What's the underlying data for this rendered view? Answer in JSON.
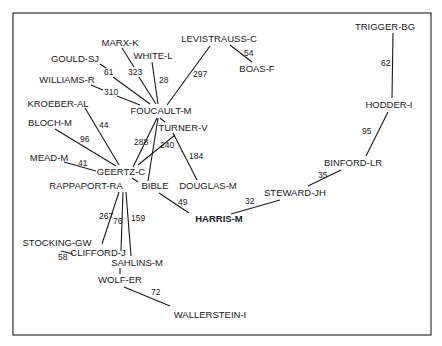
{
  "diagram": {
    "type": "network-graph",
    "nodes": [
      {
        "id": "TRIGGER-BG",
        "label": "TRIGGER-BG",
        "x": 385,
        "y": 30,
        "anchor": "middle"
      },
      {
        "id": "HODDER-I",
        "label": "HODDER-I",
        "x": 389,
        "y": 108,
        "anchor": "middle"
      },
      {
        "id": "BINFORD-LR",
        "label": "BINFORD-LR",
        "x": 353,
        "y": 166,
        "anchor": "middle"
      },
      {
        "id": "STEWARD-JH",
        "label": "STEWARD-JH",
        "x": 295,
        "y": 196,
        "anchor": "middle"
      },
      {
        "id": "HARRIS-M",
        "label": "HARRIS-M",
        "x": 219,
        "y": 222,
        "anchor": "middle",
        "bold": true
      },
      {
        "id": "LEVISTRAUSS-C",
        "label": "LEVISTRAUSS-C",
        "x": 219,
        "y": 42,
        "anchor": "middle"
      },
      {
        "id": "BOAS-F",
        "label": "BOAS-F",
        "x": 257,
        "y": 72,
        "anchor": "middle"
      },
      {
        "id": "MARX-K",
        "label": "MARX-K",
        "x": 120,
        "y": 46,
        "anchor": "middle"
      },
      {
        "id": "WHITE-L",
        "label": "WHITE-L",
        "x": 153,
        "y": 59,
        "anchor": "middle"
      },
      {
        "id": "GOULD-SJ",
        "label": "GOULD-SJ",
        "x": 75,
        "y": 62,
        "anchor": "middle"
      },
      {
        "id": "WILLIAMS-R",
        "label": "WILLIAMS-R",
        "x": 67,
        "y": 83,
        "anchor": "middle"
      },
      {
        "id": "FOUCAULT-M",
        "label": "FOUCAULT-M",
        "x": 161,
        "y": 114,
        "anchor": "middle"
      },
      {
        "id": "KROEBER-AL",
        "label": "KROEBER-AL",
        "x": 58,
        "y": 107,
        "anchor": "middle"
      },
      {
        "id": "TURNER-V",
        "label": "TURNER-V",
        "x": 183,
        "y": 131,
        "anchor": "middle"
      },
      {
        "id": "BLOCH-M",
        "label": "BLOCH-M",
        "x": 50,
        "y": 126,
        "anchor": "middle"
      },
      {
        "id": "MEAD-M",
        "label": "MEAD-M",
        "x": 49,
        "y": 161,
        "anchor": "middle"
      },
      {
        "id": "GEERTZ-C",
        "label": "GEERTZ-C",
        "x": 121,
        "y": 175,
        "anchor": "middle"
      },
      {
        "id": "RAPPAPORT-RA",
        "label": "RAPPAPORT-RA",
        "x": 86,
        "y": 189,
        "anchor": "middle"
      },
      {
        "id": "BIBLE",
        "label": "BIBLE",
        "x": 155,
        "y": 189,
        "anchor": "middle"
      },
      {
        "id": "DOUGLAS-M",
        "label": "DOUGLAS-M",
        "x": 208,
        "y": 189,
        "anchor": "middle"
      },
      {
        "id": "STOCKING-GW",
        "label": "STOCKING-GW",
        "x": 57,
        "y": 246,
        "anchor": "middle"
      },
      {
        "id": "CLIFFORD-J",
        "label": "CLIFFORD-J",
        "x": 98,
        "y": 256,
        "anchor": "middle"
      },
      {
        "id": "SAHLINS-M",
        "label": "SAHLINS-M",
        "x": 137,
        "y": 266,
        "anchor": "middle"
      },
      {
        "id": "WOLF-ER",
        "label": "WOLF-ER",
        "x": 120,
        "y": 283,
        "anchor": "middle"
      },
      {
        "id": "WALLERSTEIN-I",
        "label": "WALLERSTEIN-I",
        "x": 210,
        "y": 318,
        "anchor": "middle"
      }
    ],
    "edges": [
      {
        "from": "TRIGGER-BG",
        "to": "HODDER-I",
        "weight": "62",
        "x1": 393,
        "y1": 33,
        "x2": 392,
        "y2": 98,
        "lx": 381,
        "ly": 66
      },
      {
        "from": "HODDER-I",
        "to": "BINFORD-LR",
        "weight": "95",
        "x1": 388,
        "y1": 112,
        "x2": 366,
        "y2": 156,
        "lx": 362,
        "ly": 134
      },
      {
        "from": "BINFORD-LR",
        "to": "STEWARD-JH",
        "weight": "35",
        "x1": 341,
        "y1": 170,
        "x2": 308,
        "y2": 186,
        "lx": 318,
        "ly": 178
      },
      {
        "from": "STEWARD-JH",
        "to": "HARRIS-M",
        "weight": "32",
        "x1": 280,
        "y1": 200,
        "x2": 231,
        "y2": 214,
        "lx": 245,
        "ly": 204
      },
      {
        "from": "BIBLE",
        "to": "HARRIS-M",
        "weight": "49",
        "x1": 159,
        "y1": 193,
        "x2": 189,
        "y2": 213,
        "lx": 178,
        "ly": 205
      },
      {
        "from": "LEVISTRAUSS-C",
        "to": "BOAS-F",
        "weight": "54",
        "x1": 230,
        "y1": 45,
        "x2": 252,
        "y2": 62,
        "lx": 244,
        "ly": 56
      },
      {
        "from": "LEVISTRAUSS-C",
        "to": "FOUCAULT-M",
        "weight": "297",
        "x1": 210,
        "y1": 46,
        "x2": 167,
        "y2": 105,
        "lx": 193,
        "ly": 77
      },
      {
        "from": "MARX-K",
        "to": "FOUCAULT-M",
        "weight": "323",
        "x1": 122,
        "y1": 48,
        "x2": 134,
        "y2": 67,
        "lx": 128,
        "ly": 75
      },
      {
        "from": "MARX-K-b",
        "to": "FOUCAULT-M",
        "weight": "",
        "x1": 139,
        "y1": 77,
        "x2": 156,
        "y2": 104,
        "lx": 0,
        "ly": 0
      },
      {
        "from": "WHITE-L",
        "to": "FOUCAULT-M",
        "weight": "28",
        "x1": 152,
        "y1": 62,
        "x2": 158,
        "y2": 104,
        "lx": 159,
        "ly": 83
      },
      {
        "from": "GOULD-SJ",
        "to": "FOUCAULT-M",
        "weight": "61",
        "x1": 100,
        "y1": 64,
        "x2": 106,
        "y2": 68,
        "lx": 104,
        "ly": 75
      },
      {
        "from": "GOULD-SJ-b",
        "to": "FOUCAULT-M",
        "weight": "",
        "x1": 113,
        "y1": 77,
        "x2": 150,
        "y2": 104,
        "lx": 0,
        "ly": 0
      },
      {
        "from": "WILLIAMS-R",
        "to": "FOUCAULT-M",
        "weight": "310",
        "x1": 91,
        "y1": 85,
        "x2": 103,
        "y2": 90,
        "lx": 104,
        "ly": 95
      },
      {
        "from": "WILLIAMS-R-b",
        "to": "FOUCAULT-M",
        "weight": "",
        "x1": 117,
        "y1": 96,
        "x2": 140,
        "y2": 105,
        "lx": 0,
        "ly": 0
      },
      {
        "from": "FOUCAULT-M",
        "to": "TURNER-V",
        "weight": "",
        "x1": 160,
        "y1": 118,
        "x2": 165,
        "y2": 122,
        "lx": 0,
        "ly": 0
      },
      {
        "from": "KROEBER-AL",
        "to": "GEERTZ-C",
        "weight": "44",
        "x1": 85,
        "y1": 108,
        "x2": 119,
        "y2": 165,
        "lx": 99,
        "ly": 128
      },
      {
        "from": "BLOCH-M",
        "to": "GEERTZ-C",
        "weight": "96",
        "x1": 55,
        "y1": 129,
        "x2": 116,
        "y2": 166,
        "lx": 80,
        "ly": 142
      },
      {
        "from": "MEAD-M",
        "to": "GEERTZ-C",
        "weight": "41",
        "x1": 64,
        "y1": 162,
        "x2": 96,
        "y2": 171,
        "lx": 78,
        "ly": 166
      },
      {
        "from": "FOUCAULT-M",
        "to": "GEERTZ-C",
        "weight": "288",
        "x1": 157,
        "y1": 118,
        "x2": 133,
        "y2": 167,
        "lx": 134,
        "ly": 145
      },
      {
        "from": "FOUCAULT-M",
        "to": "BIBLE",
        "weight": "",
        "x1": 158,
        "y1": 118,
        "x2": 148,
        "y2": 181,
        "lx": 0,
        "ly": 0
      },
      {
        "from": "TURNER-V",
        "to": "GEERTZ-C",
        "weight": "240",
        "x1": 175,
        "y1": 135,
        "x2": 138,
        "y2": 165,
        "lx": 160,
        "ly": 148
      },
      {
        "from": "TURNER-V",
        "to": "DOUGLAS-M",
        "weight": "184",
        "x1": 173,
        "y1": 133,
        "x2": 197,
        "y2": 180,
        "lx": 189,
        "ly": 159
      },
      {
        "from": "GEERTZ-C",
        "to": "BIBLE",
        "weight": "",
        "x1": 132,
        "y1": 178,
        "x2": 138,
        "y2": 182,
        "lx": 0,
        "ly": 0
      },
      {
        "from": "RAPPAPORT-RA",
        "to": "STOCKING-GW",
        "weight": "267",
        "x1": 119,
        "y1": 192,
        "x2": 102,
        "y2": 244,
        "lx": 99,
        "ly": 219
      },
      {
        "from": "RAPPAPORT-RA",
        "to": "CLIFFORD-J",
        "weight": "76",
        "x1": 123,
        "y1": 192,
        "x2": 121,
        "y2": 251,
        "lx": 113,
        "ly": 224
      },
      {
        "from": "RAPPAPORT-RA",
        "to": "SAHLINS-M",
        "weight": "159",
        "x1": 126,
        "y1": 192,
        "x2": 131,
        "y2": 256,
        "lx": 131,
        "ly": 221
      },
      {
        "from": "STOCKING-GW",
        "to": "CLIFFORD-J",
        "weight": "58",
        "x1": 61,
        "y1": 251,
        "x2": 73,
        "y2": 254,
        "lx": 58,
        "ly": 260
      },
      {
        "from": "SAHLINS-M",
        "to": "WOLF-ER",
        "weight": "",
        "x1": 120,
        "y1": 268,
        "x2": 120,
        "y2": 274,
        "lx": 0,
        "ly": 0
      },
      {
        "from": "WOLF-ER",
        "to": "WALLERSTEIN-I",
        "weight": "72",
        "x1": 124,
        "y1": 287,
        "x2": 170,
        "y2": 306,
        "lx": 151,
        "ly": 295
      }
    ]
  }
}
